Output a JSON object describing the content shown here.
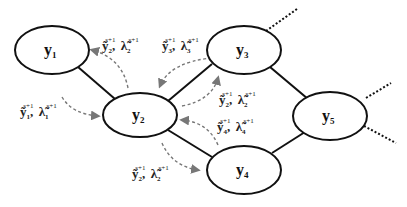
{
  "diagram": {
    "nodes": [
      {
        "id": "y1",
        "base": "y",
        "sub": "1",
        "cx": 52,
        "cy": 50
      },
      {
        "id": "y2",
        "base": "y",
        "sub": "2",
        "cx": 140,
        "cy": 115
      },
      {
        "id": "y3",
        "base": "y",
        "sub": "3",
        "cx": 244,
        "cy": 50
      },
      {
        "id": "y4",
        "base": "y",
        "sub": "4",
        "cx": 244,
        "cy": 170
      },
      {
        "id": "y5",
        "base": "y",
        "sub": "5",
        "cx": 330,
        "cy": 116
      }
    ],
    "edges": [
      {
        "from": "y1",
        "to": "y2",
        "style": "solid"
      },
      {
        "from": "y2",
        "to": "y3",
        "style": "solid"
      },
      {
        "from": "y2",
        "to": "y4",
        "style": "solid"
      },
      {
        "from": "y3",
        "to": "y5",
        "style": "solid"
      },
      {
        "from": "y4",
        "to": "y5",
        "style": "solid"
      },
      {
        "from": "y3",
        "to": "outside",
        "style": "dotted"
      },
      {
        "from": "y5",
        "to": "outside-upper",
        "style": "dotted"
      },
      {
        "from": "y5",
        "to": "outside-lower",
        "style": "dotted"
      }
    ],
    "messages": [
      {
        "id": "m-y2-to-y1",
        "y_sub": "2",
        "lambda_sub": "2",
        "sup": "s+1",
        "direction": "y2 → y1"
      },
      {
        "id": "m-y3-to-y2",
        "y_sub": "3",
        "lambda_sub": "3",
        "sup": "s+1",
        "direction": "y3 → y2"
      },
      {
        "id": "m-y1-to-y2",
        "y_sub": "1",
        "lambda_sub": "1",
        "sup": "s+1",
        "direction": "y1 → y2"
      },
      {
        "id": "m-y2-to-y3",
        "y_sub": "2",
        "lambda_sub": "2",
        "sup": "s+1",
        "direction": "y2 → y3"
      },
      {
        "id": "m-y4-to-y2",
        "y_sub": "4",
        "lambda_sub": "4",
        "sup": "s+1",
        "direction": "y4 → y2"
      },
      {
        "id": "m-y2-to-y4",
        "y_sub": "2",
        "lambda_sub": "2",
        "sup": "s+1",
        "direction": "y2 → y4"
      }
    ],
    "symbols": {
      "y_tilde": "ỹ",
      "lambda_tilde": "λ̃",
      "separator": ","
    },
    "colors": {
      "node_stroke": "#111111",
      "message_arrow": "#777777",
      "background": "#ffffff"
    }
  }
}
